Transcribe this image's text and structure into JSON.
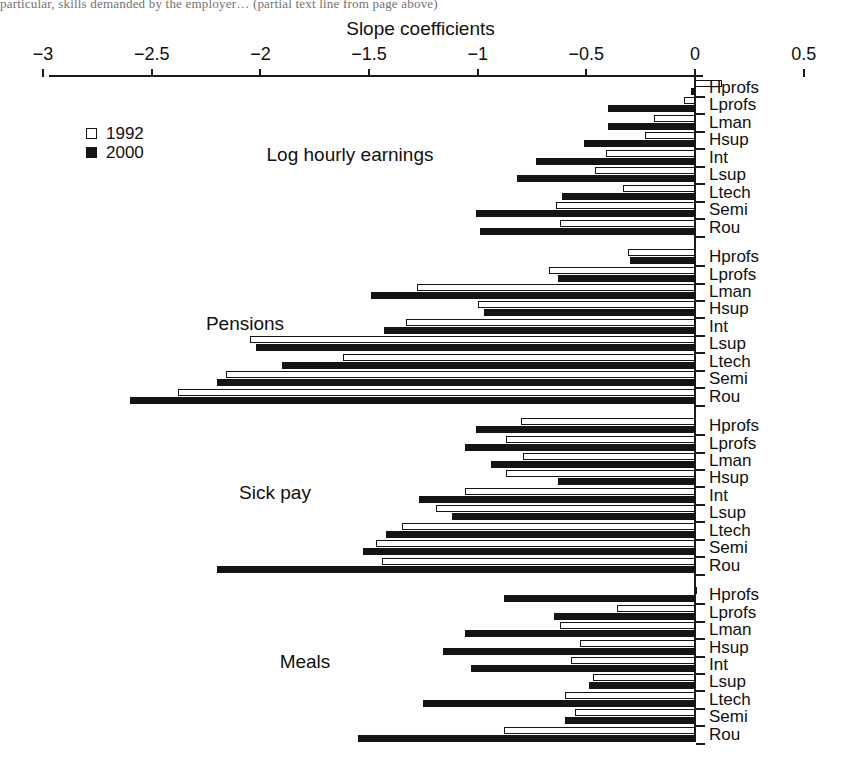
{
  "page": {
    "bleed_text_top": "particular, skills demanded by the employer… (partial text line from page above)"
  },
  "chart_data": {
    "type": "bar",
    "orientation": "horizontal",
    "title": "Slope coefficients",
    "xlabel": "",
    "ylabel": "",
    "xlim": [
      -3,
      0.5
    ],
    "xticks": [
      -3,
      -2.5,
      -2,
      -1.5,
      -1,
      -0.5,
      0,
      0.5
    ],
    "xticklabels": [
      "−3",
      "−2.5",
      "−2",
      "−1.5",
      "−1",
      "−0.5",
      "0",
      "0.5"
    ],
    "grid": false,
    "legend_position": "upper-left",
    "legend": [
      "1992",
      "2000"
    ],
    "series_colors": {
      "1992": "#ffffff",
      "2000": "#141414"
    },
    "categories": [
      "Hprofs",
      "Lprofs",
      "Lman",
      "Hsup",
      "Int",
      "Lsup",
      "Ltech",
      "Semi",
      "Rou"
    ],
    "panels": [
      {
        "name": "Log hourly earnings",
        "series": [
          {
            "name": "1992",
            "values": [
              0.125,
              -0.05,
              -0.19,
              -0.23,
              -0.41,
              -0.46,
              -0.33,
              -0.64,
              -0.62
            ]
          },
          {
            "name": "2000",
            "values": [
              -0.02,
              -0.4,
              -0.4,
              -0.51,
              -0.73,
              -0.82,
              -0.61,
              -1.01,
              -0.99
            ]
          }
        ]
      },
      {
        "name": "Pensions",
        "series": [
          {
            "name": "1992",
            "values": [
              -0.31,
              -0.67,
              -1.28,
              -1.0,
              -1.33,
              -2.05,
              -1.62,
              -2.16,
              -2.38
            ]
          },
          {
            "name": "2000",
            "values": [
              -0.3,
              -0.63,
              -1.49,
              -0.97,
              -1.43,
              -2.02,
              -1.9,
              -2.2,
              -2.6
            ]
          }
        ]
      },
      {
        "name": "Sick pay",
        "series": [
          {
            "name": "1992",
            "values": [
              -0.8,
              -0.87,
              -0.79,
              -0.87,
              -1.06,
              -1.19,
              -1.35,
              -1.47,
              -1.44
            ]
          },
          {
            "name": "2000",
            "values": [
              -1.01,
              -1.06,
              -0.94,
              -0.63,
              -1.27,
              -1.12,
              -1.42,
              -1.53,
              -2.2
            ]
          }
        ]
      },
      {
        "name": "Meals",
        "series": [
          {
            "name": "1992",
            "values": [
              0.0,
              -0.36,
              -0.62,
              -0.53,
              -0.57,
              -0.47,
              -0.6,
              -0.55,
              -0.88
            ]
          },
          {
            "name": "2000",
            "values": [
              -0.88,
              -0.65,
              -1.06,
              -1.16,
              -1.03,
              -0.49,
              -1.25,
              -0.6,
              -1.55
            ]
          }
        ]
      }
    ]
  }
}
